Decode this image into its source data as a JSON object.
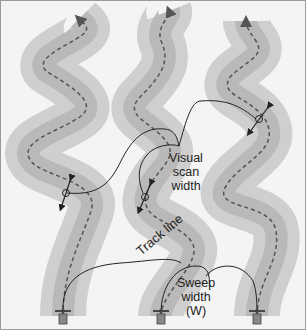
{
  "labels": {
    "visual_scan_width": [
      "Visual",
      "scan",
      "width"
    ],
    "track_line": "Track line",
    "sweep_width": [
      "Sweep",
      "width",
      "(W)"
    ]
  },
  "colors": {
    "background": "#f4f4f4",
    "outer_band": "#cfcfcf",
    "inner_band": "#b9b9b9",
    "track_dash": "#555555",
    "annotation_line": "#222222"
  },
  "tracks": [
    {
      "name": "left-track"
    },
    {
      "name": "middle-track"
    },
    {
      "name": "right-track"
    }
  ],
  "searchers": 3
}
